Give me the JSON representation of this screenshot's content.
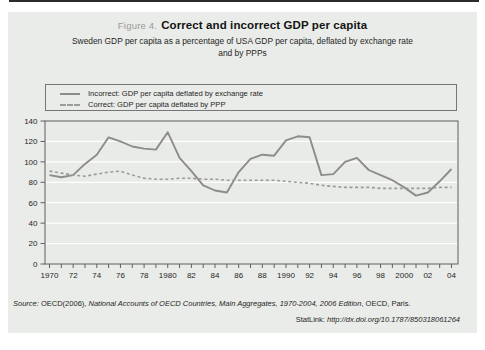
{
  "header": {
    "figure_label": "Figure 4.",
    "title": "Correct and incorrect GDP per capita",
    "subtitle_line1": "Sweden GDP per capita as a percentage of USA GDP per capita, deflated by exchange rate",
    "subtitle_line2": "and by PPPs"
  },
  "chart_data": {
    "type": "line",
    "title": "Correct and incorrect GDP per capita",
    "xlabel": "",
    "ylabel": "",
    "x_start": 1970,
    "x_end": 2004,
    "x_step": 1,
    "xtick_labels": [
      "1970",
      "72",
      "74",
      "76",
      "78",
      "1980",
      "82",
      "84",
      "86",
      "88",
      "1990",
      "92",
      "94",
      "96",
      "98",
      "2000",
      "02",
      "04"
    ],
    "ylim": [
      0,
      140
    ],
    "ytick_step": 20,
    "ytick_labels": [
      "0",
      "20",
      "40",
      "60",
      "80",
      "100",
      "120",
      "140"
    ],
    "grid": "horizontal white gridlines every 20 units",
    "legend_position": "top boxed legend above plot",
    "series": [
      {
        "name": "Incorrect: GDP per capita deflated by exchange rate",
        "style": "solid",
        "color": "#8c8c8c",
        "values": [
          87,
          85,
          87,
          98,
          107,
          124,
          120,
          115,
          113,
          112,
          129,
          104,
          91,
          77,
          72,
          70,
          90,
          103,
          107,
          106,
          121,
          125,
          124,
          87,
          88,
          100,
          104,
          92,
          87,
          82,
          75,
          67,
          70,
          81,
          93
        ]
      },
      {
        "name": "Correct: GDP per capita deflated by PPP",
        "style": "dashed",
        "color": "#9b9b9b",
        "values": [
          91,
          89,
          87,
          86,
          88,
          90,
          91,
          87,
          84,
          83,
          83,
          84,
          84,
          83,
          83,
          82,
          82,
          82,
          82,
          82,
          81,
          80,
          79,
          77,
          76,
          75,
          75,
          75,
          74,
          74,
          74,
          74,
          74,
          75,
          75
        ]
      }
    ]
  },
  "footer": {
    "source_label": "Source:",
    "source_pre": "OECD(2006),",
    "source_title": "National Accounts of OECD Countries, Main Aggregates, 1970-2004, 2006 Edition",
    "source_post": ", OECD, Paris.",
    "statlink_label": "StatLink:",
    "statlink_url": "http://dx.doi.org/10.1787/850318061264"
  },
  "colors": {
    "panel_bg": "#eaece9",
    "plot_bg": "#e9ebe8",
    "gridline": "#ffffff",
    "axis": "#5f5f5f",
    "text": "#1f1f1f",
    "figure_label": "#9a9a9a",
    "solid_series": "#8c8c8c",
    "dashed_series": "#9b9b9b"
  }
}
